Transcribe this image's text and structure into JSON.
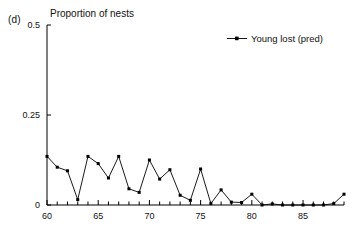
{
  "panel": {
    "label": "(d)"
  },
  "axis_title": "Proportion of nests",
  "legend": {
    "entries": [
      {
        "label": "Young lost (pred)",
        "symbol": "line-with-square-marker",
        "color": "#000000"
      }
    ]
  },
  "colors": {
    "series": "#000000",
    "axis": "#000000",
    "background": "#ffffff"
  },
  "chart_data": {
    "type": "line",
    "title": "Proportion of nests",
    "xlabel": "",
    "ylabel": "Proportion of nests",
    "xlim": [
      60,
      89
    ],
    "ylim": [
      0,
      0.5
    ],
    "ytick_labels": [
      "0",
      "0.25",
      "0.5"
    ],
    "ytick_values": [
      0,
      0.25,
      0.5
    ],
    "xtick_labels": [
      "60",
      "65",
      "70",
      "75",
      "80",
      "85"
    ],
    "xtick_values": [
      60,
      65,
      70,
      75,
      80,
      85
    ],
    "minor_xticks_every": 1,
    "grid": false,
    "legend_position": "top-right",
    "marker": "square",
    "series": [
      {
        "name": "Young lost (pred)",
        "x": [
          60,
          61,
          62,
          63,
          64,
          65,
          66,
          67,
          68,
          69,
          70,
          71,
          72,
          73,
          74,
          75,
          76,
          77,
          78,
          79,
          80,
          81,
          82,
          83,
          84,
          85,
          86,
          87,
          88,
          89
        ],
        "values": [
          0.135,
          0.105,
          0.095,
          0.015,
          0.135,
          0.115,
          0.075,
          0.135,
          0.045,
          0.035,
          0.125,
          0.072,
          0.098,
          0.027,
          0.013,
          0.1,
          0.004,
          0.042,
          0.008,
          0.007,
          0.03,
          0.0,
          0.003,
          0.0,
          0.0,
          0.0,
          0.0,
          0.0,
          0.004,
          0.03
        ]
      }
    ]
  }
}
